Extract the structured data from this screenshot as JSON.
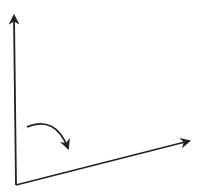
{
  "diagram": {
    "type": "vector-rotation",
    "stroke_color": "#222222",
    "background": "#ffffff",
    "origin": [
      16,
      185
    ],
    "vectors": [
      {
        "name": "vertical-vector",
        "from": [
          16,
          185
        ],
        "to": [
          14,
          12
        ]
      },
      {
        "name": "slanted-vector",
        "from": [
          16,
          185
        ],
        "to": [
          193,
          140
        ]
      }
    ],
    "rotation_arrow": {
      "from": [
        27,
        127
      ],
      "control": [
        55,
        115
      ],
      "to": [
        68,
        152
      ],
      "direction": "clockwise"
    }
  }
}
